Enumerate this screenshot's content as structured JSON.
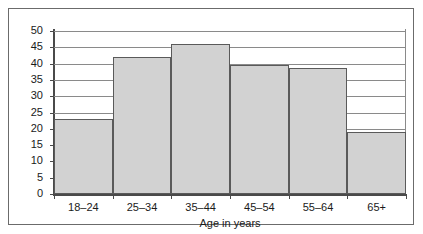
{
  "chart_data": {
    "type": "bar",
    "title": "",
    "xlabel": "Age in years",
    "ylabel": "",
    "categories": [
      "18–24",
      "25–34",
      "35–44",
      "45–54",
      "55–64",
      "65+"
    ],
    "values": [
      23,
      42,
      46,
      39.5,
      38.5,
      19
    ],
    "ylim": [
      0,
      50
    ],
    "yticks": [
      0,
      5,
      10,
      15,
      20,
      25,
      30,
      35,
      40,
      45,
      50
    ],
    "ytick_labels": [
      "0",
      "5",
      "10",
      "15",
      "20",
      "25",
      "30",
      "35",
      "40",
      "45",
      "50"
    ],
    "grid": true,
    "legend": false,
    "bar_color": "#d2d2d2",
    "bar_edge_color": "#5a5a5a",
    "axis_color": "#4a4a4a",
    "grid_color": "#8a8a8a",
    "background": "#ffffff"
  }
}
